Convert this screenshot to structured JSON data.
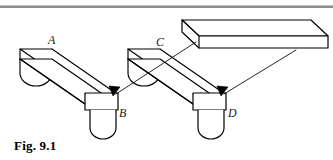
{
  "figure": {
    "caption": "Fig. 9.1",
    "title": "Fig. 9.1",
    "background_color": "#ffffff",
    "line_color": "#000000",
    "rule_color": "#8a8a8a",
    "labels": [
      {
        "id": "A",
        "text": "A",
        "x": 48,
        "y": 44
      },
      {
        "id": "B",
        "text": "B",
        "x": 119,
        "y": 117
      },
      {
        "id": "C",
        "text": "C",
        "x": 156,
        "y": 46
      },
      {
        "id": "D",
        "text": "D",
        "x": 228,
        "y": 117
      }
    ],
    "parts": [
      {
        "name": "ramp-left",
        "label": "A",
        "support_label": "B"
      },
      {
        "name": "ramp-right",
        "label": "C",
        "support_label": "D"
      },
      {
        "name": "slab-top-right",
        "label": ""
      }
    ],
    "arrows": [
      {
        "name": "arrow-to-b",
        "from_x": 193,
        "from_y": 40,
        "to_x": 113,
        "to_y": 97
      },
      {
        "name": "arrow-to-d",
        "from_x": 293,
        "from_y": 48,
        "to_x": 221,
        "to_y": 97
      }
    ]
  }
}
